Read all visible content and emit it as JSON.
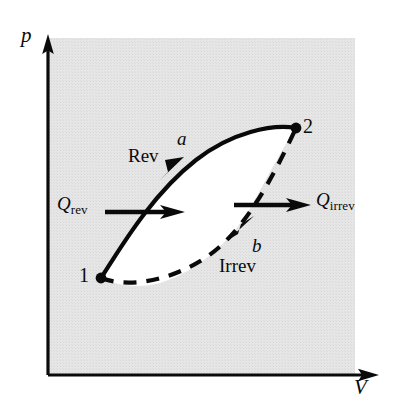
{
  "figure": {
    "type": "thermodynamic-pv-cycle-diagram"
  },
  "colors": {
    "background": "#ffffff",
    "plot_area_shading": "#e3e3e3",
    "loop_interior": "#ffffff",
    "ink": "#0a0a0a"
  },
  "axes": {
    "y_label": "p",
    "x_label": "V",
    "origin_x": 48,
    "origin_y": 375,
    "y_axis_top": 38,
    "x_axis_right": 378
  },
  "states": [
    {
      "name": "state-1",
      "label": "1",
      "x": 101,
      "y": 278
    },
    {
      "name": "state-2",
      "label": "2",
      "x": 296,
      "y": 128
    }
  ],
  "paths": [
    {
      "name": "reversible-path",
      "letter": "a",
      "process_label": "Rev",
      "style": "solid",
      "from": "1",
      "to": "2",
      "direction": "1-to-2"
    },
    {
      "name": "irreversible-path",
      "letter": "b",
      "process_label": "Irrev",
      "style": "dashed",
      "from": "1",
      "to": "2",
      "direction": "1-to-2"
    }
  ],
  "heat_arrows": [
    {
      "name": "q-rev-arrow",
      "symbol": "Q",
      "subscript": "rev",
      "x_start": 105,
      "x_end": 183,
      "y": 212
    },
    {
      "name": "q-irrev-arrow",
      "symbol": "Q",
      "subscript": "irrev",
      "x_start": 234,
      "x_end": 310,
      "y": 205
    }
  ]
}
